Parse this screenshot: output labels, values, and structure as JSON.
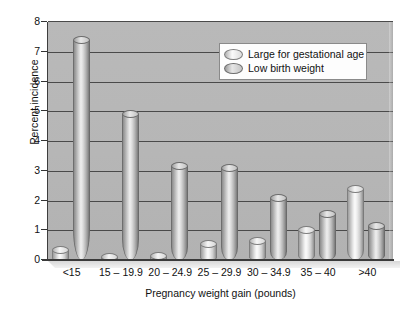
{
  "chart_data": {
    "type": "bar",
    "title": "",
    "xlabel": "Pregnancy weight gain (pounds)",
    "ylabel": "Percent incidence",
    "categories": [
      "<15",
      "15 – 19.9",
      "20 – 24.9",
      "25 – 29.9",
      "30 – 34.9",
      "35 – 40",
      ">40"
    ],
    "series": [
      {
        "name": "Large for gestational age",
        "values": [
          0.35,
          0.1,
          0.15,
          0.55,
          0.65,
          1.0,
          2.4
        ]
      },
      {
        "name": "Low birth weight",
        "values": [
          7.4,
          4.9,
          3.15,
          3.1,
          2.1,
          1.55,
          1.15
        ]
      }
    ],
    "ylim": [
      0,
      8
    ],
    "yticks": [
      0,
      1,
      2,
      3,
      4,
      5,
      6,
      7,
      8
    ],
    "ytick_labels": [
      "0",
      "1",
      "2",
      "3",
      "4",
      "5",
      "6",
      "7",
      "8"
    ],
    "grid": "horizontal",
    "legend_position": "upper-right-inside",
    "style": "3d-cylinder-bars",
    "colors": {
      "plot_background": "#b6b6b6",
      "gridline": "#4a4a4a",
      "series_large_for_gestational_age": "#e9e9e9",
      "series_low_birth_weight": "#cfcfcf",
      "text": "#111111",
      "figure_background": "#ffffff"
    }
  }
}
